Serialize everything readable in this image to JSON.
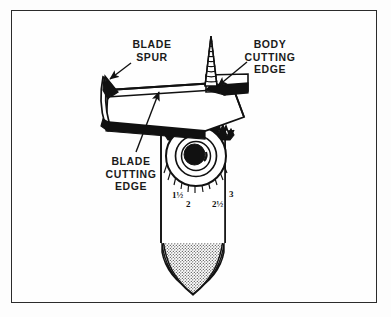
{
  "figure": {
    "border_color": "#2b2b2b",
    "background_color": "#fdfdfd",
    "ink_color": "#111111"
  },
  "labels": {
    "blade_spur": "BLADE\nSPUR",
    "blade_spur_line1": "BLADE",
    "blade_spur_line2": "SPUR",
    "body_cutting_edge_line1": "BODY",
    "body_cutting_edge_line2": "CUTTING",
    "body_cutting_edge_line3": "EDGE",
    "blade_cutting_edge_line1": "BLADE",
    "blade_cutting_edge_line2": "CUTTING",
    "blade_cutting_edge_line3": "EDGE"
  },
  "scale": {
    "caption": "graduated adjustment scale on bit body",
    "marks": [
      {
        "value": "1½",
        "x": 172,
        "y": 190
      },
      {
        "value": "2",
        "x": 186,
        "y": 199
      },
      {
        "value": "2½",
        "x": 212,
        "y": 199
      },
      {
        "value": "3",
        "x": 229,
        "y": 189
      }
    ]
  },
  "parts": [
    {
      "name": "feed-screw-point",
      "description": "threaded conical lead screw at top"
    },
    {
      "name": "cutter-blade",
      "description": "flat adjustable blade plate in perspective"
    },
    {
      "name": "blade-spur",
      "description": "pointed spur at outer end of blade"
    },
    {
      "name": "body-cutting-edge",
      "description": "solid dark cutting lip on bit body"
    },
    {
      "name": "adjustment-dial",
      "description": "circular knurled dial with concentric rings"
    },
    {
      "name": "bit-shank",
      "description": "tapered shank below the head"
    }
  ],
  "chart_data": {
    "type": "table",
    "categories": [
      "1½",
      "2",
      "2½",
      "3"
    ],
    "values": [
      1.5,
      2,
      2.5,
      3
    ],
    "xlabel": "bore diameter (inches)",
    "ylabel": ""
  }
}
